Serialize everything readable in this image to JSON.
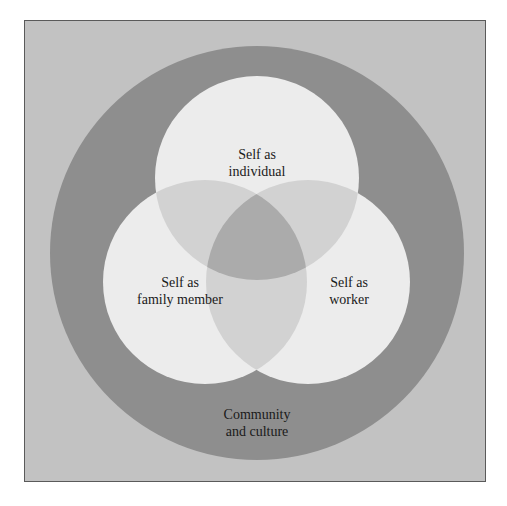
{
  "diagram": {
    "type": "venn",
    "colors": {
      "frame_bg": "#c2c2c2",
      "frame_border": "#5a5a5a",
      "outer_circle": "#8e8e8e",
      "inner_circle": "#ececec",
      "pair_overlap": "#d2d2d2",
      "center_overlap": "#ababab"
    },
    "outer": {
      "label_line1": "Community",
      "label_line2": "and culture"
    },
    "circles": [
      {
        "id": "individual",
        "label_line1": "Self as",
        "label_line2": "individual"
      },
      {
        "id": "family",
        "label_line1": "Self as",
        "label_line2": "family member"
      },
      {
        "id": "worker",
        "label_line1": "Self as",
        "label_line2": "worker"
      }
    ]
  }
}
